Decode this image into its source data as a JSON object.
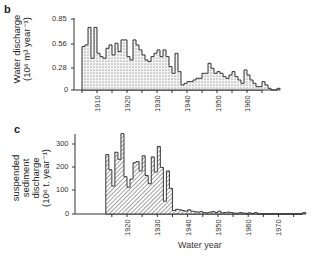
{
  "panels": {
    "b": {
      "label": "b"
    },
    "c": {
      "label": "c"
    }
  },
  "chart_data": [
    {
      "type": "bar",
      "panel": "b",
      "title": "",
      "ylabel_line1": "Water discharge",
      "ylabel_line2": "(10⁶ m³ year⁻¹)",
      "xlabel": "",
      "ylim": [
        0,
        0.85
      ],
      "yticks": [
        "0",
        "0.28",
        "0.56",
        "0.85"
      ],
      "xticks": [
        "1910",
        "1920",
        "1930",
        "1940",
        "1950",
        "1960"
      ],
      "x_start_year": 1905,
      "values": [
        0.52,
        0.54,
        0.75,
        0.38,
        0.75,
        0.44,
        0.4,
        0.38,
        0.5,
        0.54,
        0.42,
        0.56,
        0.46,
        0.6,
        0.6,
        0.4,
        0.36,
        0.6,
        0.54,
        0.48,
        0.42,
        0.36,
        0.34,
        0.4,
        0.44,
        0.48,
        0.4,
        0.48,
        0.4,
        0.28,
        0.2,
        0.44,
        0.22,
        0.06,
        0.08,
        0.1,
        0.1,
        0.12,
        0.14,
        0.14,
        0.2,
        0.2,
        0.32,
        0.26,
        0.2,
        0.22,
        0.2,
        0.16,
        0.14,
        0.18,
        0.22,
        0.16,
        0.12,
        0.08,
        0.24,
        0.18,
        0.12,
        0.08,
        0.04,
        0.04,
        0.1,
        0.06,
        0.02,
        0,
        0,
        0.02
      ],
      "fill": "stippled"
    },
    {
      "type": "bar",
      "panel": "c",
      "title": "",
      "ylabel_line1": "suspended",
      "ylabel_line2": "sediment",
      "ylabel_line3": "discharge",
      "ylabel_line4": "(10⁶ t. year⁻¹)",
      "xlabel": "Water year",
      "ylim": [
        0,
        340
      ],
      "yticks": [
        "0",
        "100",
        "200",
        "300"
      ],
      "xticks": [
        "1920",
        "1930",
        "1940",
        "1950",
        "1960",
        "1970"
      ],
      "x_start_year": 1913,
      "values": [
        255,
        190,
        120,
        265,
        235,
        345,
        160,
        115,
        150,
        220,
        225,
        185,
        250,
        165,
        130,
        245,
        180,
        290,
        200,
        55,
        185,
        110,
        15,
        20,
        18,
        15,
        12,
        18,
        12,
        10,
        8,
        10,
        6,
        5,
        8,
        10,
        6,
        12,
        5,
        6,
        8,
        6,
        4,
        3,
        6,
        4,
        3,
        5,
        2,
        6,
        0,
        0,
        0,
        0,
        0,
        0,
        0,
        0,
        0,
        0,
        0,
        0,
        0,
        0,
        0,
        6
      ],
      "fill": "hatched"
    }
  ]
}
